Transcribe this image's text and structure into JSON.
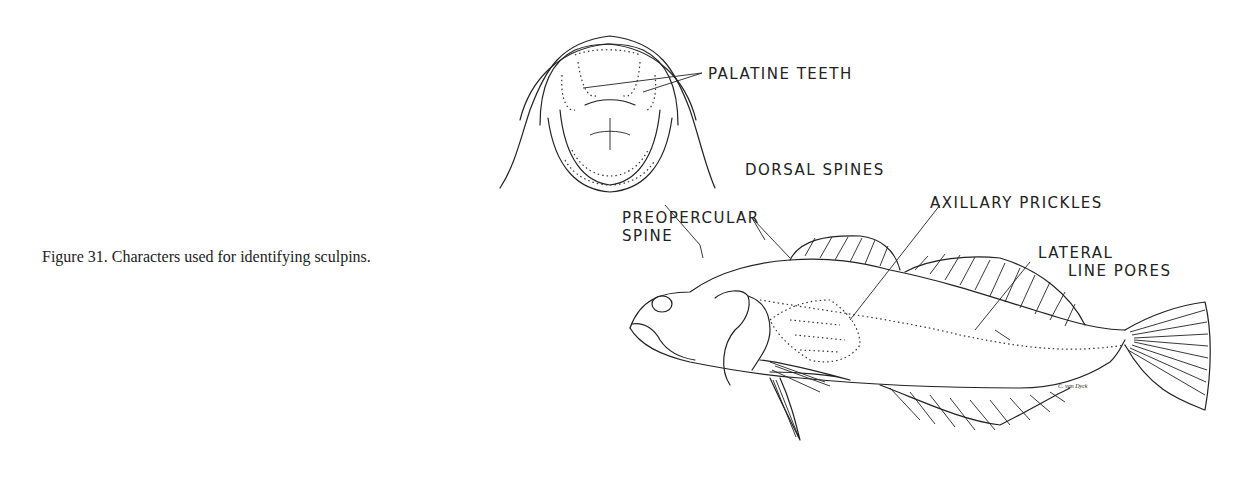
{
  "figure": {
    "caption": "Figure 31.  Characters used for identifying sculpins.",
    "labels": {
      "palatine_teeth": "PALATINE TEETH",
      "dorsal_spines": "DORSAL SPINES",
      "axillary_prickles": "AXILLARY PRICKLES",
      "preopercular_line1": "PREOPERCULAR",
      "preopercular_line2": "SPINE",
      "lateral_line1": "LATERAL",
      "lateral_line2": "LINE PORES"
    },
    "signature": "C. van Dyck",
    "colors": {
      "ink": "#222222",
      "background": "#ffffff"
    }
  }
}
